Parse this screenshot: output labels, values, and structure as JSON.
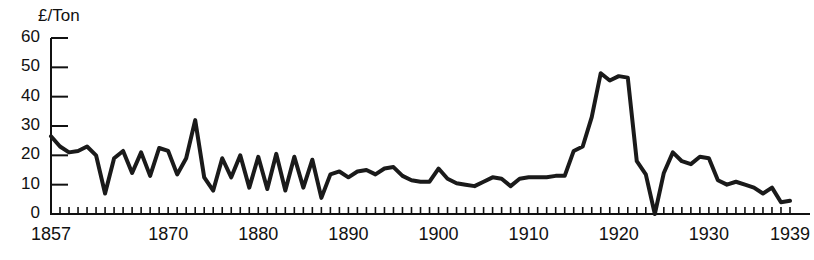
{
  "chart_data": {
    "type": "line",
    "title": "",
    "subtitle": "",
    "xlabel": "",
    "ylabel": "£/Ton",
    "xlim": [
      1857,
      1939
    ],
    "ylim": [
      0,
      60
    ],
    "grid": false,
    "legend": "none",
    "y_ticks": [
      0,
      10,
      20,
      30,
      40,
      50,
      60
    ],
    "y_tick_labels": [
      "0",
      "10",
      "20",
      "30",
      "40",
      "50",
      "60"
    ],
    "x_tick_labels": [
      "1857",
      "1870",
      "1880",
      "1890",
      "1900",
      "1910",
      "1920",
      "1930",
      "1939"
    ],
    "x_tick_label_years": [
      1857,
      1870,
      1880,
      1890,
      1900,
      1910,
      1920,
      1930,
      1939
    ],
    "x_minor_tick_interval": 1,
    "line_color": "#1a1a1a",
    "line_width": 4,
    "series": [
      {
        "name": "Price",
        "x": [
          1857,
          1858,
          1859,
          1860,
          1861,
          1862,
          1863,
          1864,
          1865,
          1866,
          1867,
          1868,
          1869,
          1870,
          1871,
          1872,
          1873,
          1874,
          1875,
          1876,
          1877,
          1878,
          1879,
          1880,
          1881,
          1882,
          1883,
          1884,
          1885,
          1886,
          1887,
          1888,
          1889,
          1890,
          1891,
          1892,
          1893,
          1894,
          1895,
          1896,
          1897,
          1898,
          1899,
          1900,
          1901,
          1902,
          1903,
          1904,
          1905,
          1906,
          1907,
          1908,
          1909,
          1910,
          1911,
          1912,
          1913,
          1914,
          1915,
          1916,
          1917,
          1918,
          1919,
          1920,
          1921,
          1922,
          1923,
          1924,
          1925,
          1926,
          1927,
          1928,
          1929,
          1930,
          1931,
          1932,
          1933,
          1934,
          1935,
          1936,
          1937,
          1938,
          1939
        ],
        "y": [
          26.5,
          23.0,
          21.0,
          21.5,
          23.0,
          20.0,
          7.0,
          19.0,
          21.5,
          14.0,
          21.0,
          13.0,
          22.5,
          21.5,
          13.5,
          19.0,
          32.0,
          12.5,
          8.0,
          19.0,
          12.5,
          20.0,
          9.0,
          19.5,
          8.5,
          20.5,
          8.0,
          19.5,
          9.0,
          18.5,
          5.5,
          13.5,
          14.5,
          12.5,
          14.5,
          15.0,
          13.5,
          15.5,
          16.0,
          13.0,
          11.5,
          11.0,
          11.0,
          15.5,
          12.0,
          10.5,
          10.0,
          9.5,
          11.0,
          12.5,
          12.0,
          9.5,
          12.0,
          12.5,
          12.5,
          12.5,
          13.0,
          13.0,
          21.5,
          23.0,
          33.0,
          48.0,
          45.5,
          47.0,
          46.5,
          18.0,
          13.5,
          0.0,
          14.0,
          21.0,
          18.0,
          17.0,
          19.5,
          19.0,
          11.5,
          10.0,
          11.0,
          10.0,
          9.0,
          7.0,
          9.0,
          4.0,
          4.5
        ],
        "units": "£/Ton"
      }
    ],
    "annotations": []
  },
  "axes": {
    "y_axis_caption": "£/Ton"
  }
}
